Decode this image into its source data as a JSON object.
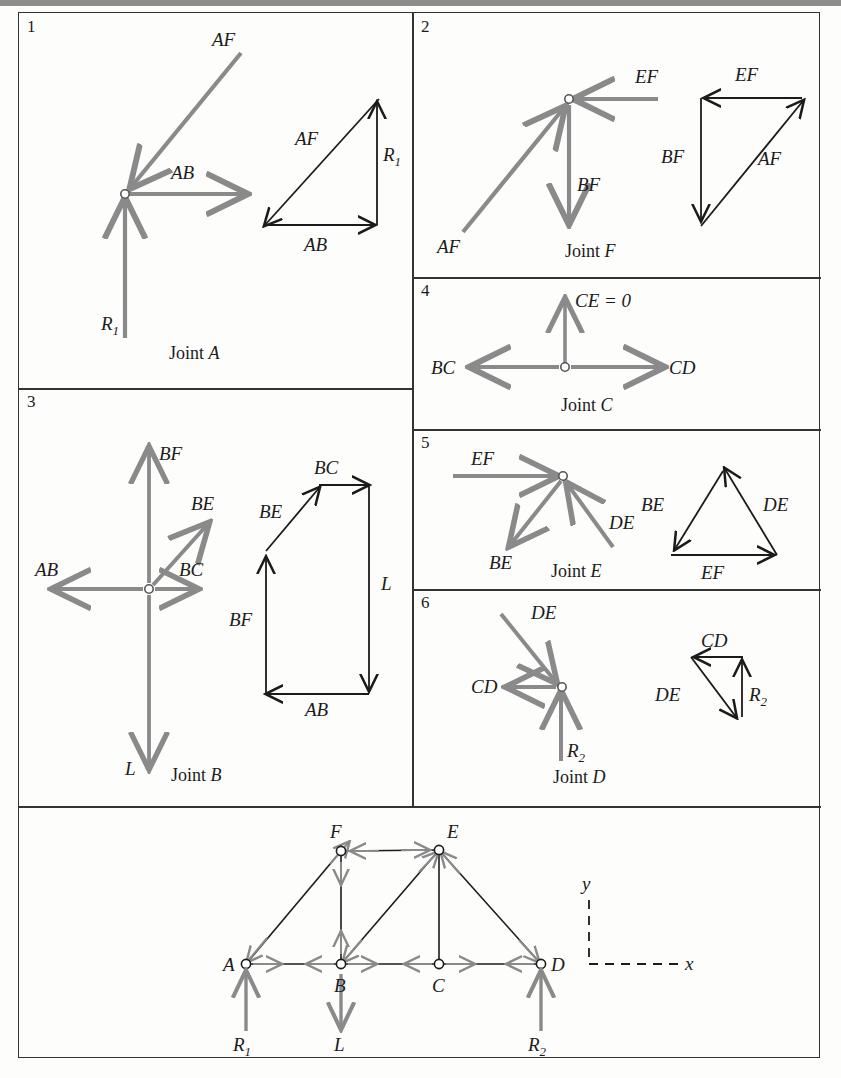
{
  "figure": {
    "panels": [
      {
        "number": "1",
        "caption_prefix": "Joint ",
        "caption_joint": "A",
        "fbd_labels": [
          "AF",
          "AB",
          "R1"
        ],
        "polygon_labels": [
          "AF",
          "R1",
          "AB"
        ]
      },
      {
        "number": "2",
        "caption_prefix": "Joint ",
        "caption_joint": "F",
        "fbd_labels": [
          "EF",
          "BF",
          "AF"
        ],
        "polygon_labels": [
          "EF",
          "BF",
          "AF"
        ]
      },
      {
        "number": "3",
        "caption_prefix": "Joint ",
        "caption_joint": "B",
        "fbd_labels": [
          "BF",
          "BE",
          "AB",
          "BC",
          "L"
        ],
        "polygon_labels": [
          "BC",
          "BE",
          "BF",
          "L",
          "AB"
        ]
      },
      {
        "number": "4",
        "caption_prefix": "Joint ",
        "caption_joint": "C",
        "fbd_labels": [
          "CE = 0",
          "BC",
          "CD"
        ],
        "polygon_labels": []
      },
      {
        "number": "5",
        "caption_prefix": "Joint ",
        "caption_joint": "E",
        "fbd_labels": [
          "EF",
          "BE",
          "DE"
        ],
        "polygon_labels": [
          "BE",
          "DE",
          "EF"
        ]
      },
      {
        "number": "6",
        "caption_prefix": "Joint ",
        "caption_joint": "D",
        "fbd_labels": [
          "DE",
          "CD",
          "R2"
        ],
        "polygon_labels": [
          "CD",
          "DE",
          "R2"
        ]
      }
    ],
    "truss": {
      "joint_labels": [
        "A",
        "B",
        "C",
        "D",
        "E",
        "F"
      ],
      "load_labels": [
        "R1",
        "L",
        "R2"
      ],
      "axis_labels": [
        "y",
        "x"
      ]
    },
    "labels": {
      "AF": "AF",
      "AB": "AB",
      "BC": "BC",
      "BE": "BE",
      "BF": "BF",
      "CD": "CD",
      "CE_zero": "CE = 0",
      "DE": "DE",
      "EF": "EF",
      "L": "L",
      "R1_base": "R",
      "R1_sub": "1",
      "R2_base": "R",
      "R2_sub": "2",
      "joint_word": "Joint",
      "A": "A",
      "B": "B",
      "C": "C",
      "D": "D",
      "E": "E",
      "F": "F",
      "x": "x",
      "y": "y"
    },
    "colors": {
      "fbd_arrow": "#8a8a8a",
      "polygon_line": "#1b1b1b",
      "frame": "#33332f",
      "text": "#1b1b1b",
      "background": "#fdfdfc",
      "top_band": "#8d8d8d"
    }
  }
}
